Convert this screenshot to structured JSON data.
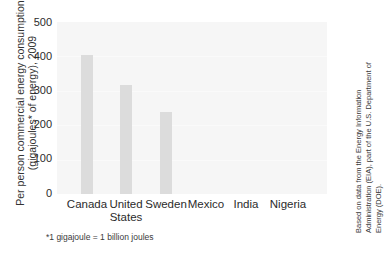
{
  "chart_data": {
    "type": "bar",
    "title": "",
    "categories": [
      "Canada",
      "United States",
      "Sweden",
      "Mexico",
      "India",
      "Nigeria"
    ],
    "values": [
      405,
      318,
      237,
      0,
      0,
      0
    ],
    "xlabel": "",
    "ylabel": "Per person commercial energy consumption (gigajoules* of energy), 2009",
    "ylim": [
      0,
      500
    ],
    "ytick_labels": [
      "0",
      "100",
      "200",
      "300",
      "400",
      "500"
    ],
    "ytick_values": [
      0,
      100,
      200,
      300,
      400,
      500
    ],
    "grid": false,
    "legend": "none",
    "bar_color": "#dcdcdc",
    "plot_background": "#f6f6f6",
    "text_color": "#2b2b2b"
  },
  "axis": {
    "y_title_line1": "Per person commercial energy consumption",
    "y_title_line2": "(gigajoules* of energy), 2009",
    "x_labels": [
      {
        "line1": "Canada",
        "line2": ""
      },
      {
        "line1": "United",
        "line2": "States"
      },
      {
        "line1": "Sweden",
        "line2": ""
      },
      {
        "line1": "Mexico",
        "line2": ""
      },
      {
        "line1": "India",
        "line2": ""
      },
      {
        "line1": "Nigeria",
        "line2": ""
      }
    ]
  },
  "notes": {
    "footnote": "*1 gigajoule = 1 billion joules",
    "source_line1": "Based on data from the Energy Information",
    "source_line2": "Administration (EIA), part of the U.S. Department of",
    "source_line3": "Energy (DOE)."
  }
}
